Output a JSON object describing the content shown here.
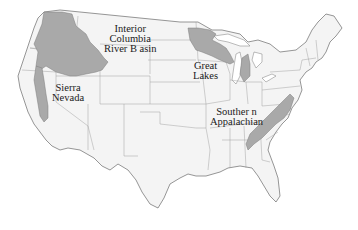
{
  "map": {
    "title": "",
    "subject": "Contiguous United States",
    "colors": {
      "background": "#ffffff",
      "land": "#f4f4f4",
      "border": "#6a6a6a",
      "region_fill": "#a9a9a9",
      "label_text": "#1a1a1a"
    },
    "regions": [
      {
        "id": "interior-columbia",
        "label_lines": [
          "Interior",
          "Columbia",
          "River B asin"
        ],
        "label_position": {
          "x": 100,
          "y": 26
        }
      },
      {
        "id": "sierra-nevada",
        "label_lines": [
          "Sierra",
          "Nevada"
        ],
        "label_position": {
          "x": 50,
          "y": 83
        }
      },
      {
        "id": "great-lakes",
        "label_lines": [
          "Great",
          "Lakes"
        ],
        "label_position": {
          "x": 190,
          "y": 63
        }
      },
      {
        "id": "southern-appalachian",
        "label_lines": [
          "Souther n",
          "Appalachian"
        ],
        "label_position": {
          "x": 208,
          "y": 109
        }
      }
    ]
  }
}
